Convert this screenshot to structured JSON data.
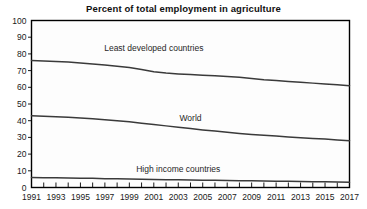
{
  "chart_data": {
    "type": "line",
    "title": "Percent of total employment in agriculture",
    "xlabel": "",
    "ylabel": "",
    "xlim": [
      1991,
      2017
    ],
    "ylim": [
      0,
      100
    ],
    "grid": false,
    "legend_position": "inline-labels",
    "y_ticks": [
      0,
      10,
      20,
      30,
      40,
      50,
      60,
      70,
      80,
      90,
      100
    ],
    "x_ticks": [
      1991,
      1993,
      1995,
      1997,
      1999,
      2001,
      2003,
      2005,
      2007,
      2009,
      2011,
      2013,
      2015,
      2017
    ],
    "x_tick_labels": [
      "1991",
      "1993",
      "1995",
      "1997",
      "1999",
      "2001",
      "2003",
      "2005",
      "2007",
      "2009",
      "2011",
      "2013",
      "2015",
      "2017"
    ],
    "x": [
      1991,
      1992,
      1993,
      1994,
      1995,
      1996,
      1997,
      1998,
      1999,
      2000,
      2001,
      2002,
      2003,
      2004,
      2005,
      2006,
      2007,
      2008,
      2009,
      2010,
      2011,
      2012,
      2013,
      2014,
      2015,
      2016,
      2017
    ],
    "series": [
      {
        "name": "Least developed countries",
        "color": "#3a3a3a",
        "label_x": 2001,
        "label_y": 82,
        "values": [
          76,
          75.8,
          75.5,
          75.1,
          74.6,
          74.0,
          73.3,
          72.6,
          71.8,
          70.6,
          69.3,
          68.5,
          68.0,
          67.6,
          67.2,
          66.9,
          66.5,
          66.0,
          65.3,
          64.5,
          64.0,
          63.5,
          63.0,
          62.5,
          62.0,
          61.5,
          61.0
        ]
      },
      {
        "name": "World",
        "color": "#3a3a3a",
        "label_x": 2004,
        "label_y": 40,
        "values": [
          43,
          42.7,
          42.4,
          42.0,
          41.6,
          41.1,
          40.6,
          40.0,
          39.3,
          38.5,
          37.7,
          36.9,
          36.1,
          35.3,
          34.5,
          33.8,
          33.1,
          32.4,
          31.8,
          31.3,
          30.8,
          30.3,
          29.8,
          29.4,
          29.0,
          28.5,
          28.0
        ]
      },
      {
        "name": "High income countries",
        "color": "#3a3a3a",
        "label_x": 2003,
        "label_y": 9,
        "values": [
          6.0,
          5.9,
          5.8,
          5.7,
          5.6,
          5.5,
          5.3,
          5.2,
          5.1,
          5.0,
          4.8,
          4.7,
          4.6,
          4.5,
          4.4,
          4.3,
          4.2,
          4.1,
          4.0,
          3.9,
          3.8,
          3.7,
          3.6,
          3.5,
          3.4,
          3.3,
          3.2
        ]
      }
    ]
  }
}
